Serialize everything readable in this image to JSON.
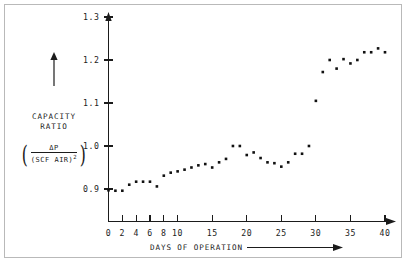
{
  "figure": {
    "background_color": "#ffffff",
    "border_color": "#b9b9b9",
    "point_color": "#111111",
    "axis_color": "#1b1b1b"
  },
  "y_axis": {
    "caption_line1": "CAPACITY",
    "caption_line2": "RATIO",
    "formula_numerator": "ΔP",
    "formula_denominator": "(SCF AIR)",
    "formula_denominator_exponent": "2",
    "formula_open_paren": "(",
    "formula_close_paren": ")",
    "arrow": "up-arrow-icon",
    "tick_labels": [
      "0.9",
      "1.0",
      "1.1",
      "1.2",
      "1.3"
    ]
  },
  "x_axis": {
    "caption": "DAYS OF OPERATION",
    "arrow": "right-arrow-icon",
    "tick_labels": [
      "0",
      "2",
      "4",
      "6",
      "8",
      "10",
      "15",
      "20",
      "25",
      "30",
      "35",
      "40"
    ]
  },
  "chart_data": {
    "type": "scatter",
    "title": "",
    "xlabel": "DAYS OF OPERATION",
    "ylabel": "CAPACITY RATIO (ΔP/(SCF AIR)^2)",
    "xlim": [
      0,
      41.5
    ],
    "ylim": [
      0.855,
      1.32
    ],
    "xticks": [
      0,
      2,
      4,
      6,
      8,
      10,
      15,
      20,
      25,
      30,
      35,
      40
    ],
    "yticks": [
      0.9,
      1.0,
      1.1,
      1.2,
      1.3
    ],
    "grid": false,
    "legend": false,
    "marker": "filled-square",
    "x": [
      0,
      1,
      2,
      3,
      4,
      5,
      6,
      7,
      8,
      9,
      10,
      11,
      12,
      13,
      14,
      15,
      16,
      17,
      18,
      19,
      20,
      21,
      22,
      23,
      24,
      25,
      26,
      27,
      28,
      29,
      30,
      31,
      32,
      33,
      34,
      35,
      36,
      37,
      38,
      39,
      40
    ],
    "y": [
      0.897,
      0.896,
      0.896,
      0.91,
      0.917,
      0.917,
      0.917,
      0.906,
      0.931,
      0.938,
      0.941,
      0.945,
      0.95,
      0.955,
      0.958,
      0.95,
      0.962,
      0.97,
      1.0,
      1.0,
      0.979,
      0.985,
      0.972,
      0.962,
      0.96,
      0.952,
      0.962,
      0.982,
      0.982,
      1.0,
      1.105,
      1.172,
      1.2,
      1.18,
      1.202,
      1.192,
      1.2,
      1.218,
      1.218,
      1.227,
      1.218
    ]
  }
}
